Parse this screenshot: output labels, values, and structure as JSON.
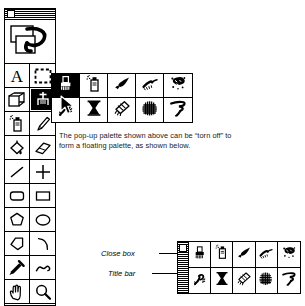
{
  "document": {
    "kind": "mac-paint-application-tool-palette-figure",
    "background": "#ffffff",
    "ink": "#000000"
  },
  "tool_palette": {
    "name": "Tools",
    "close_box": "close-box",
    "title_bar": "title-bar",
    "preview": {
      "name": "pattern-preview",
      "icon": "lasso-selection-preview"
    },
    "columns": 2,
    "tools": [
      {
        "icon": "text-tool-A",
        "label": "A",
        "selected": false
      },
      {
        "icon": "marquee-selection-icon",
        "label": "Selection",
        "selected": false
      },
      {
        "icon": "shape-transform-icon",
        "label": "Shape",
        "selected": false
      },
      {
        "icon": "paint-bucket-icon",
        "label": "Paint",
        "selected": true
      },
      {
        "icon": "spray-can-icon",
        "label": "Spray",
        "selected": false
      },
      {
        "icon": "pencil-icon",
        "label": "Pencil",
        "selected": false
      },
      {
        "icon": "fill-bucket-icon",
        "label": "Fill",
        "selected": false
      },
      {
        "icon": "eraser-icon",
        "label": "Eraser",
        "selected": false
      },
      {
        "icon": "line-icon",
        "label": "Line",
        "selected": false
      },
      {
        "icon": "crosshair-icon",
        "label": "Crosshair",
        "selected": false
      },
      {
        "icon": "rounded-rectangle-icon",
        "label": "Rounded Rect",
        "selected": false
      },
      {
        "icon": "rectangle-icon",
        "label": "Rectangle",
        "selected": false
      },
      {
        "icon": "polygon-icon",
        "label": "Polygon",
        "selected": false
      },
      {
        "icon": "ellipse-icon",
        "label": "Ellipse",
        "selected": false
      },
      {
        "icon": "freeform-shape-icon",
        "label": "Freeform",
        "selected": false
      },
      {
        "icon": "arc-icon",
        "label": "Arc",
        "selected": false
      },
      {
        "icon": "eyedropper-icon",
        "label": "Eyedropper",
        "selected": false
      },
      {
        "icon": "squiggle-icon",
        "label": "Squiggle",
        "selected": false
      },
      {
        "icon": "hand-icon",
        "label": "Hand",
        "selected": false
      },
      {
        "icon": "magnifier-icon",
        "label": "Zoom",
        "selected": false
      }
    ]
  },
  "popup_palette": {
    "name": "pop-up-palette",
    "columns": 5,
    "rows": 2,
    "active_index": 0,
    "items": [
      {
        "icon": "paint-brush-icon",
        "label": "Paint Brush"
      },
      {
        "icon": "spray-can-icon",
        "label": "Spray Can"
      },
      {
        "icon": "wide-brush-icon",
        "label": "Wide Brush"
      },
      {
        "icon": "charcoal-icon",
        "label": "Charcoal"
      },
      {
        "icon": "splatter-icon",
        "label": "Splatter"
      },
      {
        "icon": "smoke-swirl-icon",
        "label": "Smoke"
      },
      {
        "icon": "hourglass-icon",
        "label": "Hourglass"
      },
      {
        "icon": "chalk-icon",
        "label": "Chalk"
      },
      {
        "icon": "grid-texture-icon",
        "label": "Grid Texture"
      },
      {
        "icon": "ribbon-icon",
        "label": "Ribbon"
      }
    ]
  },
  "caption": {
    "name": "figure-caption",
    "text": "The pop-up palette shown above can be “torn off” to form a floating palette, as shown below."
  },
  "floating_palette": {
    "name": "torn-off-floating-palette",
    "columns": 5,
    "rows": 2,
    "title_bar": "vertical-title-bar",
    "close_box": "close-box",
    "items": [
      {
        "icon": "paint-brush-icon",
        "label": "Paint Brush"
      },
      {
        "icon": "spray-can-icon",
        "label": "Spray Can"
      },
      {
        "icon": "wide-brush-icon",
        "label": "Wide Brush"
      },
      {
        "icon": "charcoal-icon",
        "label": "Charcoal"
      },
      {
        "icon": "splatter-icon",
        "label": "Splatter"
      },
      {
        "icon": "smoke-swirl-icon",
        "label": "Smoke"
      },
      {
        "icon": "hourglass-icon",
        "label": "Hourglass"
      },
      {
        "icon": "chalk-icon",
        "label": "Chalk"
      },
      {
        "icon": "grid-texture-icon",
        "label": "Grid Texture"
      },
      {
        "icon": "ribbon-icon",
        "label": "Ribbon"
      }
    ]
  },
  "annotations": [
    {
      "name": "close-box-callout",
      "text": "Close box"
    },
    {
      "name": "title-bar-callout",
      "text": "Title bar"
    }
  ],
  "cursor": {
    "name": "arrow-cursor",
    "icon": "arrow-pointer"
  }
}
